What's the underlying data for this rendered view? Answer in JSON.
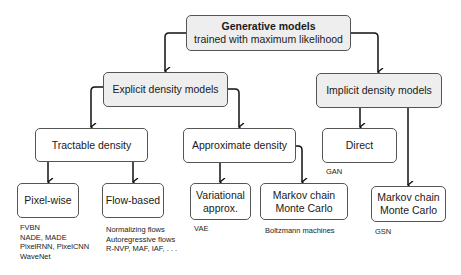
{
  "diagram": {
    "root": {
      "title": "Generative models",
      "subtitle": "trained with maximum likelihood"
    },
    "explicit": {
      "label": "Explicit density models"
    },
    "implicit": {
      "label": "Implicit density models"
    },
    "tractable": {
      "label": "Tractable density"
    },
    "approximate": {
      "label": "Approximate density"
    },
    "direct": {
      "label": "Direct",
      "examples": [
        "GAN"
      ]
    },
    "pixelwise": {
      "label": "Pixel-wise",
      "examples": [
        "FVBN",
        "NADE, MADE",
        "PixelRNN, PixelCNN",
        "WaveNet"
      ]
    },
    "flowbased": {
      "label": "Flow-based",
      "examples": [
        "Normalizing flows",
        "Autoregressive flows",
        "R-NVP, MAF, IAF, . . ."
      ]
    },
    "variational": {
      "label_line1": "Variational",
      "label_line2": "approx.",
      "examples": [
        "VAE"
      ]
    },
    "mcmc_explicit": {
      "label_line1": "Markov chain",
      "label_line2": "Monte Carlo",
      "examples": [
        "Boltzmann machines"
      ]
    },
    "mcmc_implicit": {
      "label_line1": "Markov chain",
      "label_line2": "Monte Carlo",
      "examples": [
        "GSN"
      ]
    }
  }
}
